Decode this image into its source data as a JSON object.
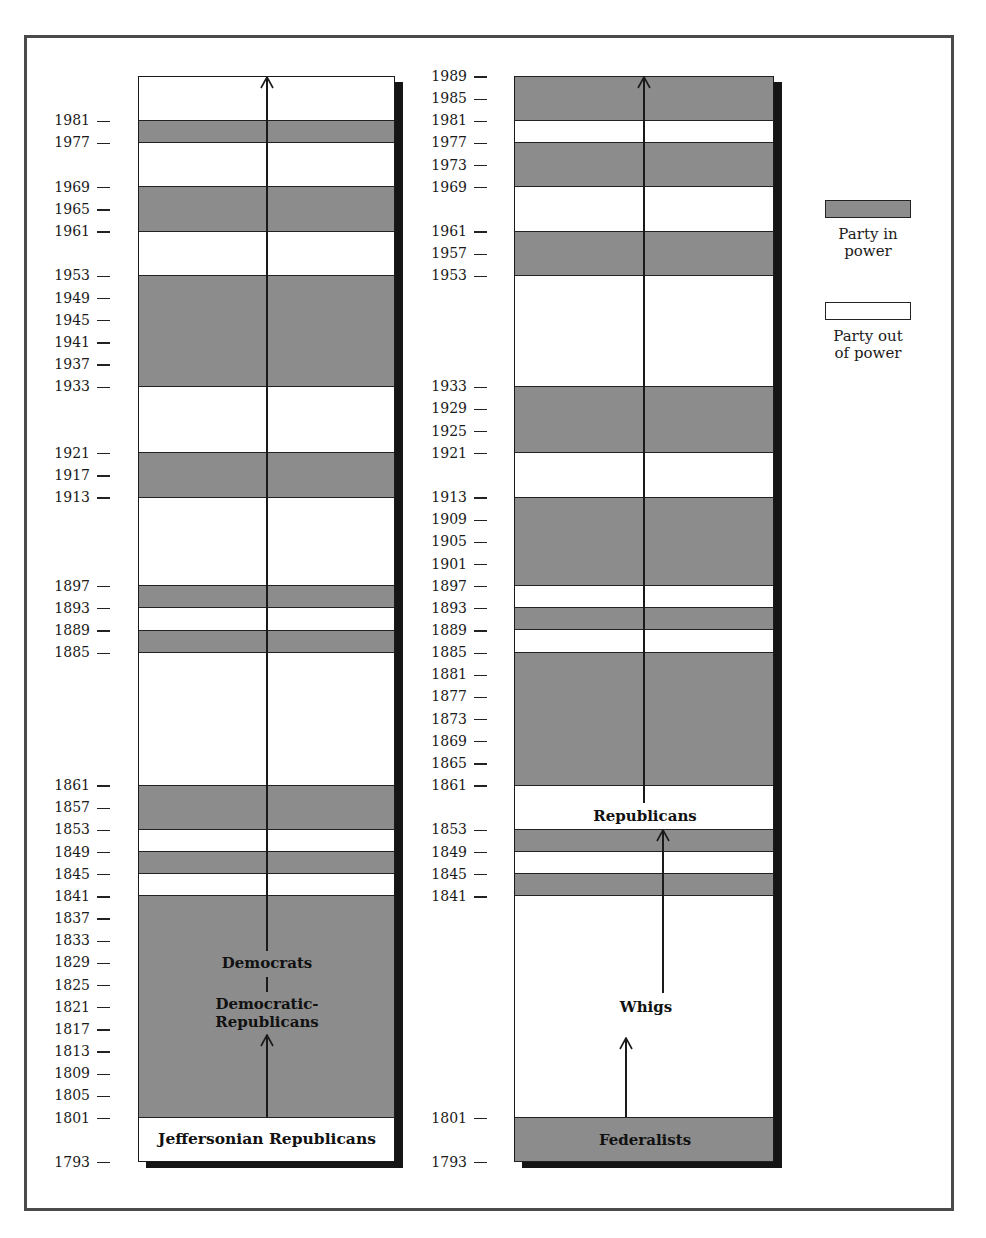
{
  "figure": {
    "scale": {
      "top_year": 1989,
      "top_y": 76,
      "px_per_year": 5.54
    },
    "legend": {
      "in_power_label_line1": "Party in",
      "in_power_label_line2": "power",
      "out_power_label_line1": "Party out",
      "out_power_label_line2": "of power",
      "in_power_color": "#a9a9a9",
      "out_power_color": "#ffffff"
    },
    "left_column": {
      "title": "Democratic lineage",
      "box_top_year": 1989,
      "box_bottom_year": 1793,
      "ticks": [
        1981,
        1977,
        1969,
        1965,
        1961,
        1953,
        1949,
        1945,
        1941,
        1937,
        1933,
        1921,
        1917,
        1913,
        1897,
        1893,
        1889,
        1885,
        1861,
        1857,
        1853,
        1849,
        1845,
        1841,
        1837,
        1833,
        1829,
        1825,
        1821,
        1817,
        1813,
        1809,
        1805,
        1801,
        1793
      ],
      "in_power_bands": [
        [
          1977,
          1981
        ],
        [
          1961,
          1969
        ],
        [
          1933,
          1953
        ],
        [
          1913,
          1921
        ],
        [
          1893,
          1897
        ],
        [
          1885,
          1889
        ],
        [
          1853,
          1861
        ],
        [
          1845,
          1849
        ],
        [
          1801,
          1841
        ]
      ],
      "labels": {
        "democrats": "Democrats",
        "democratic_republicans_line1": "Democratic-",
        "democratic_republicans_line2": "Republicans",
        "jeffersonian": "Jeffersonian Republicans"
      }
    },
    "right_column": {
      "title": "Federalist / Whig / Republican lineage",
      "box_top_year": 1989,
      "box_bottom_year": 1793,
      "ticks": [
        1989,
        1985,
        1981,
        1977,
        1973,
        1969,
        1961,
        1957,
        1953,
        1933,
        1929,
        1925,
        1921,
        1913,
        1909,
        1905,
        1901,
        1897,
        1893,
        1889,
        1885,
        1881,
        1877,
        1873,
        1869,
        1865,
        1861,
        1853,
        1849,
        1845,
        1841,
        1801,
        1793
      ],
      "in_power_bands": [
        [
          1981,
          1989
        ],
        [
          1969,
          1977
        ],
        [
          1953,
          1961
        ],
        [
          1921,
          1933
        ],
        [
          1897,
          1913
        ],
        [
          1889,
          1893
        ],
        [
          1861,
          1885
        ],
        [
          1849,
          1853
        ],
        [
          1841,
          1845
        ],
        [
          1793,
          1801
        ]
      ],
      "labels": {
        "republicans": "Republicans",
        "whigs": "Whigs",
        "federalists": "Federalists"
      }
    }
  },
  "chart_data": {
    "type": "timeline",
    "title": "",
    "xlabel": "",
    "ylabel": "Year",
    "ylim": [
      1793,
      1989
    ],
    "legend": [
      "Party in power",
      "Party out of power"
    ],
    "series": [
      {
        "name": "Jeffersonian Republicans → Democratic-Republicans → Democrats",
        "periods_in_power": [
          [
            1801,
            1841
          ],
          [
            1845,
            1849
          ],
          [
            1853,
            1861
          ],
          [
            1885,
            1889
          ],
          [
            1893,
            1897
          ],
          [
            1913,
            1921
          ],
          [
            1933,
            1953
          ],
          [
            1961,
            1969
          ],
          [
            1977,
            1981
          ]
        ]
      },
      {
        "name": "Federalists → Whigs → Republicans",
        "periods_in_power": [
          [
            1793,
            1801
          ],
          [
            1841,
            1845
          ],
          [
            1849,
            1853
          ],
          [
            1861,
            1885
          ],
          [
            1889,
            1893
          ],
          [
            1897,
            1913
          ],
          [
            1921,
            1933
          ],
          [
            1953,
            1961
          ],
          [
            1969,
            1977
          ],
          [
            1981,
            1989
          ]
        ]
      }
    ],
    "annotations": [
      "Jeffersonian Republicans",
      "Democratic-Republicans",
      "Democrats",
      "Federalists",
      "Whigs",
      "Republicans"
    ]
  }
}
